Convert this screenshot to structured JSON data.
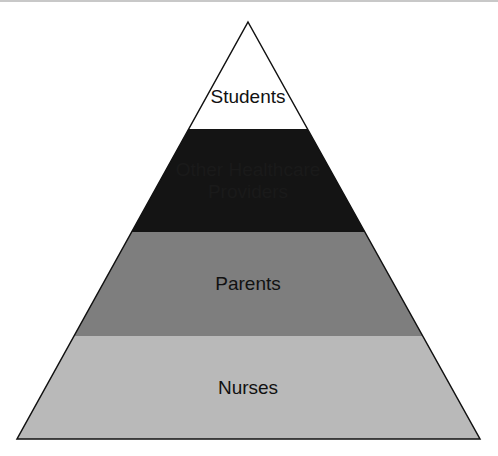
{
  "diagram": {
    "type": "pyramid",
    "levels": [
      {
        "label_lines": [
          "Students"
        ],
        "fill": "#ffffff"
      },
      {
        "label_lines": [
          "Other Healthcare",
          "Providers"
        ],
        "fill": "#141414"
      },
      {
        "label_lines": [
          "Parents"
        ],
        "fill": "#7e7e7e"
      },
      {
        "label_lines": [
          "Nurses"
        ],
        "fill": "#b9b9b9"
      }
    ],
    "outline_color": "#111111"
  }
}
